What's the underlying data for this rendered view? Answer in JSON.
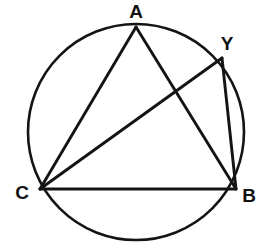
{
  "figure": {
    "kind": "circle-geometry-diagram",
    "canvas": {
      "width": 265,
      "height": 247,
      "background": "#ffffff"
    },
    "ink_color": "#141414",
    "label_color": "#111111",
    "circle": {
      "name": "circumscribed-circle",
      "cx": 136,
      "cy": 132,
      "r": 108,
      "stroke_width": 2.6
    },
    "points": [
      {
        "id": "A",
        "label": "A",
        "x": 136,
        "y": 27,
        "label_x": 136,
        "label_y": 18
      },
      {
        "id": "Y",
        "label": "Y",
        "x": 222,
        "y": 58,
        "label_x": 227,
        "label_y": 50
      },
      {
        "id": "B",
        "label": "B",
        "x": 236,
        "y": 189,
        "label_x": 249,
        "label_y": 202
      },
      {
        "id": "C",
        "label": "C",
        "x": 40,
        "y": 189,
        "label_x": 22,
        "label_y": 199
      }
    ],
    "segments": [
      {
        "id": "AC",
        "from": "A",
        "to": "C",
        "x1": 136,
        "y1": 27,
        "x2": 40,
        "y2": 189
      },
      {
        "id": "AB",
        "from": "A",
        "to": "B",
        "x1": 136,
        "y1": 27,
        "x2": 236,
        "y2": 189
      },
      {
        "id": "CY",
        "from": "C",
        "to": "Y",
        "x1": 40,
        "y1": 189,
        "x2": 222,
        "y2": 58
      },
      {
        "id": "CB",
        "from": "C",
        "to": "B",
        "x1": 40,
        "y1": 189,
        "x2": 236,
        "y2": 189
      },
      {
        "id": "YB",
        "from": "Y",
        "to": "B",
        "x1": 222,
        "y1": 58,
        "x2": 236,
        "y2": 189
      }
    ]
  }
}
